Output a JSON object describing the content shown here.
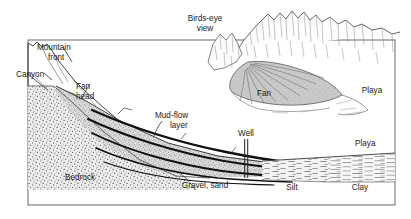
{
  "figure": {
    "type": "geologic-cross-section",
    "frame_color": "#6b6b6b",
    "ink_color": "#1a1a1a"
  },
  "labels": {
    "mountain_front_line1": "Mountain",
    "mountain_front_line2": "front",
    "canyon": "Canyon",
    "fan_head_line1": "Fan",
    "fan_head_line2": "head",
    "mudflow_line1": "Mud-flow",
    "mudflow_line2": "layer",
    "well": "Well",
    "playa_section": "Playa",
    "bedrock": "Bedrock",
    "gravel_sand": "Gravel, sand",
    "silt": "Silt",
    "clay": "Clay"
  },
  "inset": {
    "title_line1": "Birds-eye",
    "title_line2": "view",
    "fan": "Fan",
    "playa": "Playa"
  },
  "units": [
    {
      "name": "bedrock",
      "pattern": "coarse-stipple",
      "tone": "#e8e8e8"
    },
    {
      "name": "fan-deposits",
      "pattern": "fine-stipple",
      "tone": "#d9d9d9"
    },
    {
      "name": "mud-flow",
      "pattern": "solid-dark",
      "tone": "#141414"
    },
    {
      "name": "silt",
      "pattern": "short-dashes",
      "tone": "#efefef"
    },
    {
      "name": "clay",
      "pattern": "horizontal-lines",
      "tone": "#f7f7f7"
    }
  ]
}
